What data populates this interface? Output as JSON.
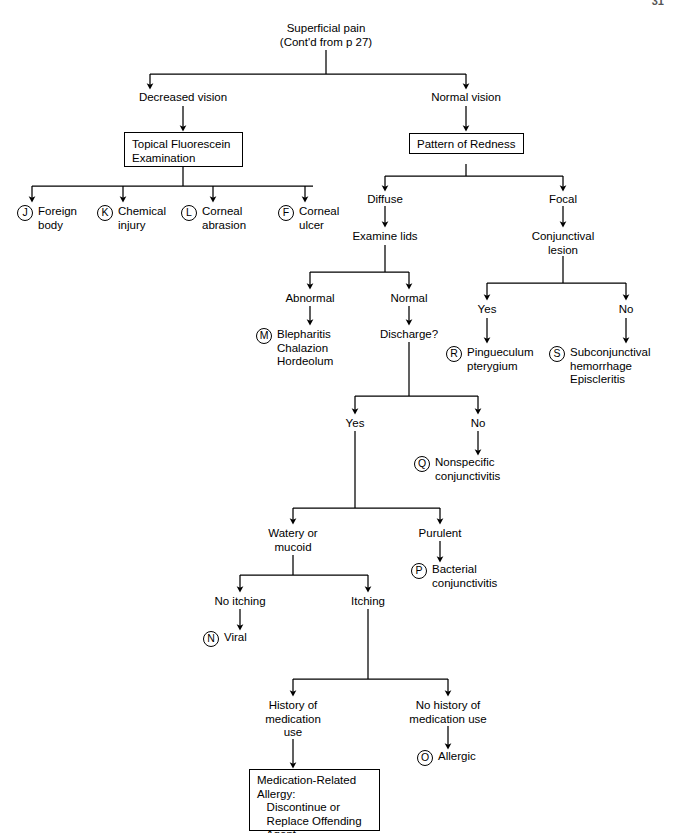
{
  "document": {
    "page_number": "31",
    "title": "Superficial pain decision tree"
  },
  "nodes": {
    "root": "Superficial pain\n(Cont'd from p 27)",
    "decreased_vision": "Decreased vision",
    "normal_vision": "Normal vision",
    "topical_fluorescein_box": "Topical Fluorescein\nExamination",
    "pattern_of_redness_box": "Pattern of Redness",
    "foreign_body": "Foreign\nbody",
    "chemical_injury": "Chemical\ninjury",
    "corneal_abrasion": "Corneal\nabrasion",
    "corneal_ulcer": "Corneal\nulcer",
    "diffuse": "Diffuse",
    "focal": "Focal",
    "examine_lids": "Examine lids",
    "conjunctival_lesion": "Conjunctival\nlesion",
    "abnormal": "Abnormal",
    "normal": "Normal",
    "blepharitis": "Blepharitis\nChalazion\nHordeolum",
    "discharge_q": "Discharge?",
    "lesion_yes": "Yes",
    "lesion_no": "No",
    "pingueculum": "Pingueculum\npterygium",
    "subconjunctival": "Subconjunctival\nhemorrhage\nEpiscleritis",
    "discharge_yes": "Yes",
    "discharge_no": "No",
    "nonspecific_conjunctivitis": "Nonspecific\nconjunctivitis",
    "watery_or_mucoid": "Watery or\nmucoid",
    "purulent": "Purulent",
    "bacterial_conjunctivitis": "Bacterial\nconjunctivitis",
    "no_itching": "No itching",
    "itching": "Itching",
    "viral": "Viral",
    "history_of_medication_use": "History of\nmedication\nuse",
    "no_history_of_medication_use": "No history of\nmedication use",
    "allergic": "Allergic",
    "medication_related_box": "Medication-Related\nAllergy:\n   Discontinue or\n   Replace Offending\n   Agent"
  },
  "markers": {
    "j": "J",
    "k": "K",
    "l": "L",
    "f": "F",
    "m": "M",
    "r": "R",
    "s": "S",
    "q": "Q",
    "p": "P",
    "n": "N",
    "o": "O"
  },
  "style": {
    "line_color": "#000000",
    "background": "#ffffff"
  }
}
